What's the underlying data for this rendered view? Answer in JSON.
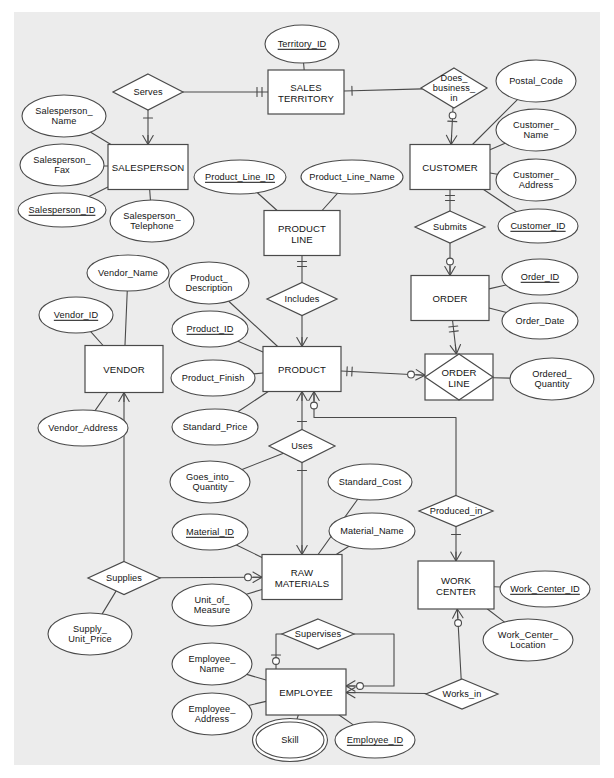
{
  "diagram": {
    "type": "entity-relationship-diagram",
    "notation": "crows-foot",
    "background_color": "#ececec",
    "line_color": "#4a4a4a",
    "shape_fill": "#ffffff",
    "text_color": "#141414"
  },
  "entities": [
    {
      "id": "sales_territory",
      "label": "SALES\nTERRITORY",
      "x": 306,
      "y": 92,
      "w": 76,
      "h": 44
    },
    {
      "id": "salesperson",
      "label": "SALESPERSON",
      "x": 148,
      "y": 167,
      "w": 80,
      "h": 45
    },
    {
      "id": "customer",
      "label": "CUSTOMER",
      "x": 450,
      "y": 167,
      "w": 80,
      "h": 45
    },
    {
      "id": "product_line",
      "label": "PRODUCT\nLINE",
      "x": 302,
      "y": 233,
      "w": 76,
      "h": 45
    },
    {
      "id": "order",
      "label": "ORDER",
      "x": 450,
      "y": 298,
      "w": 78,
      "h": 45
    },
    {
      "id": "vendor",
      "label": "VENDOR",
      "x": 124,
      "y": 369,
      "w": 78,
      "h": 47
    },
    {
      "id": "product",
      "label": "PRODUCT",
      "x": 302,
      "y": 369,
      "w": 78,
      "h": 45
    },
    {
      "id": "raw_materials",
      "label": "RAW\nMATERIALS",
      "x": 302,
      "y": 577,
      "w": 80,
      "h": 45
    },
    {
      "id": "work_center",
      "label": "WORK\nCENTER",
      "x": 456,
      "y": 585,
      "w": 76,
      "h": 48
    },
    {
      "id": "employee",
      "label": "EMPLOYEE",
      "x": 306,
      "y": 692,
      "w": 80,
      "h": 46
    }
  ],
  "associative_entities": [
    {
      "id": "order_line",
      "label": "ORDER\nLINE",
      "x": 459,
      "y": 377,
      "w": 68,
      "h": 46
    }
  ],
  "relationships": [
    {
      "id": "serves",
      "label": "Serves",
      "x": 148,
      "y": 92,
      "w": 70,
      "h": 36
    },
    {
      "id": "does_business_in",
      "label": "Does_\nbusiness_\nin",
      "x": 454,
      "y": 88,
      "w": 66,
      "h": 40
    },
    {
      "id": "submits",
      "label": "Submits",
      "x": 450,
      "y": 227,
      "w": 70,
      "h": 32
    },
    {
      "id": "includes",
      "label": "Includes",
      "x": 302,
      "y": 299,
      "w": 70,
      "h": 33
    },
    {
      "id": "uses",
      "label": "Uses",
      "x": 302,
      "y": 446,
      "w": 66,
      "h": 33
    },
    {
      "id": "supplies",
      "label": "Supplies",
      "x": 124,
      "y": 578,
      "w": 72,
      "h": 33
    },
    {
      "id": "produced_in",
      "label": "Produced_in",
      "x": 456,
      "y": 511,
      "w": 74,
      "h": 31
    },
    {
      "id": "supervises",
      "label": "Supervises",
      "x": 318,
      "y": 634,
      "w": 72,
      "h": 30
    },
    {
      "id": "works_in",
      "label": "Works_in",
      "x": 462,
      "y": 694,
      "w": 72,
      "h": 30
    }
  ],
  "attributes": [
    {
      "id": "territory_id",
      "label": "Territory_ID",
      "x": 302,
      "y": 44,
      "rx": 37,
      "ry": 19,
      "key": true,
      "multivalued": false
    },
    {
      "id": "salesperson_name",
      "label": "Salesperson_\nName",
      "x": 64,
      "y": 116,
      "rx": 42,
      "ry": 21,
      "key": false,
      "multivalued": false
    },
    {
      "id": "salesperson_fax",
      "label": "Salesperson_\nFax",
      "x": 62,
      "y": 165,
      "rx": 42,
      "ry": 21,
      "key": false,
      "multivalued": false
    },
    {
      "id": "salesperson_id",
      "label": "Salesperson_ID",
      "x": 62,
      "y": 210,
      "rx": 44,
      "ry": 17,
      "key": true,
      "multivalued": false
    },
    {
      "id": "salesperson_telephone",
      "label": "Salesperson_\nTelephone",
      "x": 152,
      "y": 221,
      "rx": 42,
      "ry": 21,
      "key": false,
      "multivalued": false
    },
    {
      "id": "postal_code",
      "label": "Postal_Code",
      "x": 536,
      "y": 81,
      "rx": 40,
      "ry": 21,
      "key": false,
      "multivalued": false
    },
    {
      "id": "customer_name",
      "label": "Customer_\nName",
      "x": 536,
      "y": 130,
      "rx": 40,
      "ry": 21,
      "key": false,
      "multivalued": false
    },
    {
      "id": "customer_address",
      "label": "Customer_\nAddress",
      "x": 536,
      "y": 180,
      "rx": 40,
      "ry": 21,
      "key": false,
      "multivalued": false
    },
    {
      "id": "customer_id",
      "label": "Customer_ID",
      "x": 538,
      "y": 226,
      "rx": 40,
      "ry": 17,
      "key": true,
      "multivalued": false
    },
    {
      "id": "product_line_id",
      "label": "Product_Line_ID",
      "x": 240,
      "y": 177,
      "rx": 46,
      "ry": 17,
      "key": true,
      "multivalued": false
    },
    {
      "id": "product_line_name",
      "label": "Product_Line_Name",
      "x": 352,
      "y": 177,
      "rx": 51,
      "ry": 17,
      "key": false,
      "multivalued": false
    },
    {
      "id": "order_id",
      "label": "Order_ID",
      "x": 540,
      "y": 277,
      "rx": 38,
      "ry": 18,
      "key": true,
      "multivalued": false
    },
    {
      "id": "order_date",
      "label": "Order_Date",
      "x": 540,
      "y": 321,
      "rx": 38,
      "ry": 18,
      "key": false,
      "multivalued": false
    },
    {
      "id": "ordered_quantity",
      "label": "Ordered_\nQuantity",
      "x": 552,
      "y": 379,
      "rx": 42,
      "ry": 21,
      "key": false,
      "multivalued": false
    },
    {
      "id": "vendor_name",
      "label": "Vendor_Name",
      "x": 128,
      "y": 273,
      "rx": 41,
      "ry": 18,
      "key": false,
      "multivalued": false
    },
    {
      "id": "vendor_id",
      "label": "Vendor_ID",
      "x": 76,
      "y": 315,
      "rx": 37,
      "ry": 18,
      "key": true,
      "multivalued": false
    },
    {
      "id": "vendor_address",
      "label": "Vendor_Address",
      "x": 83,
      "y": 428,
      "rx": 45,
      "ry": 18,
      "key": false,
      "multivalued": false
    },
    {
      "id": "product_description",
      "label": "Product_\nDescription",
      "x": 209,
      "y": 283,
      "rx": 40,
      "ry": 21,
      "key": false,
      "multivalued": false
    },
    {
      "id": "product_id",
      "label": "Product_ID",
      "x": 210,
      "y": 329,
      "rx": 38,
      "ry": 18,
      "key": true,
      "multivalued": false
    },
    {
      "id": "product_finish",
      "label": "Product_Finish",
      "x": 213,
      "y": 378,
      "rx": 42,
      "ry": 18,
      "key": false,
      "multivalued": false
    },
    {
      "id": "standard_price",
      "label": "Standard_Price",
      "x": 215,
      "y": 427,
      "rx": 43,
      "ry": 18,
      "key": false,
      "multivalued": false
    },
    {
      "id": "goes_into_quantity",
      "label": "Goes_into_\nQuantity",
      "x": 210,
      "y": 482,
      "rx": 40,
      "ry": 21,
      "key": false,
      "multivalued": false
    },
    {
      "id": "standard_cost",
      "label": "Standard_Cost",
      "x": 370,
      "y": 482,
      "rx": 42,
      "ry": 18,
      "key": false,
      "multivalued": false
    },
    {
      "id": "material_id",
      "label": "Material_ID",
      "x": 210,
      "y": 532,
      "rx": 38,
      "ry": 18,
      "key": true,
      "multivalued": false
    },
    {
      "id": "material_name",
      "label": "Material_Name",
      "x": 372,
      "y": 531,
      "rx": 43,
      "ry": 18,
      "key": false,
      "multivalued": false
    },
    {
      "id": "unit_of_measure",
      "label": "Unit_of_\nMeasure",
      "x": 212,
      "y": 605,
      "rx": 40,
      "ry": 21,
      "key": false,
      "multivalued": false
    },
    {
      "id": "supply_unit_price",
      "label": "Supply_\nUnit_Price",
      "x": 90,
      "y": 634,
      "rx": 42,
      "ry": 21,
      "key": false,
      "multivalued": false
    },
    {
      "id": "work_center_id",
      "label": "Work_Center_ID",
      "x": 545,
      "y": 589,
      "rx": 45,
      "ry": 18,
      "key": true,
      "multivalued": false
    },
    {
      "id": "work_center_location",
      "label": "Work_Center_\nLocation",
      "x": 528,
      "y": 640,
      "rx": 45,
      "ry": 21,
      "key": false,
      "multivalued": false
    },
    {
      "id": "employee_name",
      "label": "Employee_\nName",
      "x": 212,
      "y": 664,
      "rx": 40,
      "ry": 21,
      "key": false,
      "multivalued": false
    },
    {
      "id": "employee_address",
      "label": "Employee_\nAddress",
      "x": 212,
      "y": 714,
      "rx": 40,
      "ry": 21,
      "key": false,
      "multivalued": false
    },
    {
      "id": "skill",
      "label": "Skill",
      "x": 290,
      "y": 740,
      "rx": 34,
      "ry": 18,
      "key": false,
      "multivalued": true
    },
    {
      "id": "employee_id",
      "label": "Employee_ID",
      "x": 375,
      "y": 740,
      "rx": 40,
      "ry": 18,
      "key": true,
      "multivalued": false
    }
  ]
}
